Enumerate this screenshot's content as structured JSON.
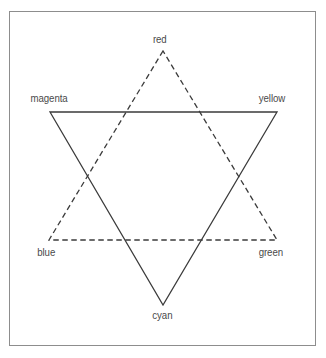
{
  "figure": {
    "frame": {
      "border_color": "#8d8d8d",
      "background": "#ffffff"
    }
  },
  "chart_data": {
    "type": "diagram",
    "title": "",
    "xlabel": "",
    "ylabel": "",
    "line_color": "#3b3b3b",
    "shapes": [
      {
        "name": "subtractive-triangle",
        "stroke": "solid",
        "stroke_color": "#3b3b3b",
        "stroke_width": 1.3,
        "vertices": [
          {
            "label": "magenta",
            "x": 50,
            "y": 112
          },
          {
            "label": "yellow",
            "x": 277,
            "y": 112
          },
          {
            "label": "cyan",
            "x": 163,
            "y": 305
          }
        ]
      },
      {
        "name": "additive-triangle",
        "stroke": "dashed",
        "stroke_color": "#3b3b3b",
        "stroke_width": 1.3,
        "dash_pattern": "5.5 3.5",
        "vertices": [
          {
            "label": "red",
            "x": 163,
            "y": 51
          },
          {
            "label": "blue",
            "x": 49,
            "y": 240
          },
          {
            "label": "green",
            "x": 277,
            "y": 240
          }
        ]
      }
    ],
    "labels": [
      {
        "id": "red",
        "text": "red",
        "x": 163,
        "y": 39,
        "anchor": "middle"
      },
      {
        "id": "magenta",
        "text": "magenta",
        "x": 50,
        "y": 98,
        "anchor": "start"
      },
      {
        "id": "yellow",
        "text": "yellow",
        "x": 277,
        "y": 98,
        "anchor": "end"
      },
      {
        "id": "blue",
        "text": "blue",
        "x": 49,
        "y": 252,
        "anchor": "start"
      },
      {
        "id": "green",
        "text": "green",
        "x": 277,
        "y": 252,
        "anchor": "end"
      },
      {
        "id": "cyan",
        "text": "cyan",
        "x": 163,
        "y": 315,
        "anchor": "middle"
      }
    ]
  },
  "labels": {
    "red": "red",
    "magenta": "magenta",
    "yellow": "yellow",
    "blue": "blue",
    "green": "green",
    "cyan": "cyan"
  }
}
